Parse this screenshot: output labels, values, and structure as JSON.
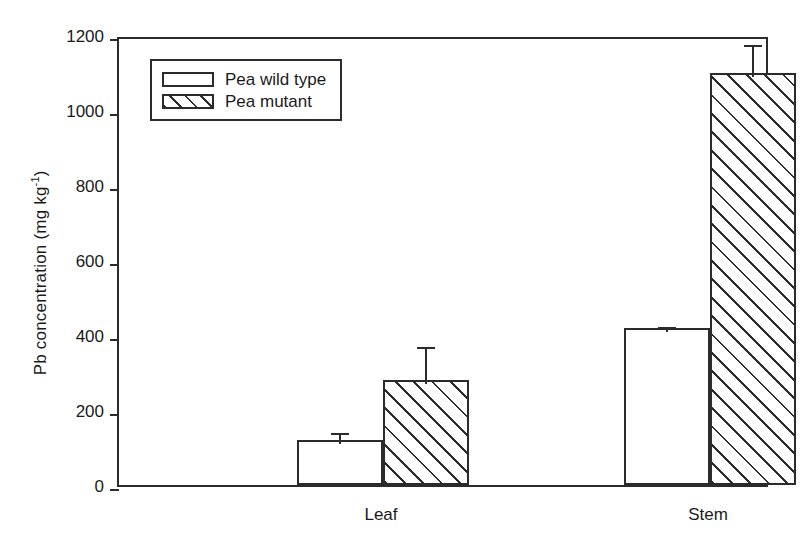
{
  "chart_data": {
    "type": "bar",
    "title": "",
    "xlabel": "",
    "ylabel": "Pb concentration (mg kg",
    "ylabel_sup": "-1",
    "ylabel_close": ")",
    "categories": [
      "Leaf",
      "Stem"
    ],
    "series": [
      {
        "name": "Pea wild type",
        "fill": "white",
        "values": [
          120,
          420
        ],
        "errors": [
          30,
          12
        ]
      },
      {
        "name": "Pea mutant",
        "fill": "hatched",
        "values": [
          280,
          1100
        ],
        "errors": [
          100,
          85
        ]
      }
    ],
    "ylim": [
      0,
      1200
    ],
    "yticks": [
      1200,
      1000,
      800,
      600,
      400,
      200,
      0
    ],
    "ytick_labels": [
      "1200",
      "1000",
      "800",
      "600",
      "400",
      "200",
      "0"
    ],
    "grid": false,
    "legend_position": "upper left",
    "axis_color": "#2b2b2b",
    "background_color": "#ffffff"
  },
  "legend": {
    "entries": [
      {
        "label": "Pea wild type"
      },
      {
        "label": "Pea mutant"
      }
    ]
  }
}
